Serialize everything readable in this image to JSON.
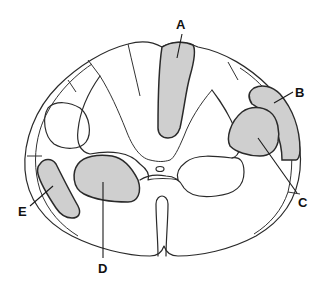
{
  "diagram": {
    "colors": {
      "background": "#ffffff",
      "outline": "#2a2a2a",
      "highlight_fill": "#cfcfcf"
    },
    "labels": [
      {
        "id": "A",
        "text": "A"
      },
      {
        "id": "B",
        "text": "B"
      },
      {
        "id": "C",
        "text": "C"
      },
      {
        "id": "D",
        "text": "D"
      },
      {
        "id": "E",
        "text": "E"
      }
    ]
  }
}
